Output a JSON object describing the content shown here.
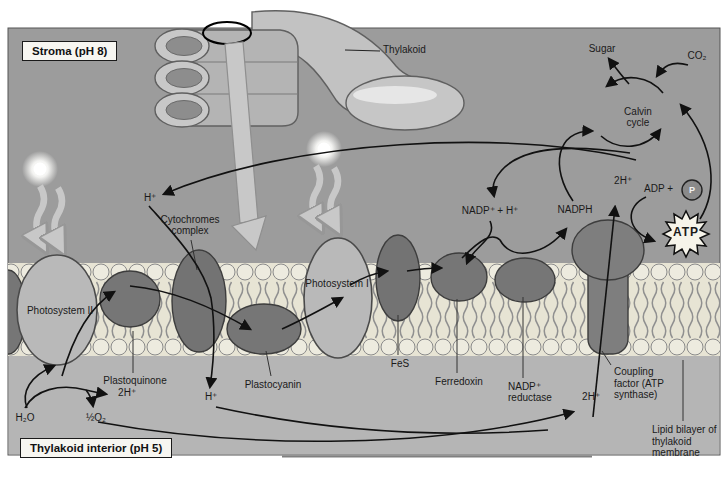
{
  "figure": {
    "type": "textbook-diagram"
  },
  "boxes": {
    "stroma": "Stroma (pH 8)",
    "interior": "Thylakoid interior (pH 5)"
  },
  "top": {
    "thylakoid": "Thylakoid",
    "sugar": "Sugar",
    "co2": "CO₂",
    "calvin1": "Calvin",
    "calvin2": "cycle"
  },
  "stroma_side": {
    "h_plus": "H⁺",
    "nadp_h": "NADP⁺ + H⁺",
    "nadph": "NADPH",
    "two_h": "2H⁺",
    "adp": "ADP +",
    "p": "P",
    "atp": "ATP"
  },
  "membrane": {
    "ps2": "Photosystem II",
    "ps1": "Photosystem I",
    "cyt1": "Cytochromes",
    "cyt2": "complex",
    "pq": "Plastoquinone",
    "pq_h": "2H⁺",
    "plastocyanin": "Plastocyanin",
    "fes": "FeS",
    "ferredoxin": "Ferredoxin",
    "red1": "NADP⁺",
    "red2": "reductase",
    "coupling": "Coupling factor (ATP synthase)",
    "lipid": "Lipid bilayer of thylakoid membrane"
  },
  "interior_side": {
    "h2o": "H₂O",
    "half_o2": "½O₂",
    "h_plus": "H⁺",
    "two_h": "2H⁺"
  },
  "icons": {
    "light_source": "sun-burst-icon",
    "light_rays": "wavy-arrow-icon",
    "granum": "granum-stack-icon",
    "magnifier": "detail-callout-ellipse-icon",
    "zoom_arrow": "zoom-pointer-arrow-icon",
    "phosphate": "circled-P-icon",
    "atp_burst": "starburst-icon"
  },
  "colors": {
    "stroma_bg": "#9c9c9c",
    "interior_bg": "#b5b5b5",
    "membrane_cream": "#e7e4d4",
    "lipid_head": "#edebdf",
    "protein_dark": "#767676",
    "protein_light": "#b9b9b9",
    "arrow_black": "#111111",
    "light_gray_arrow": "#c8c8c8",
    "label_box_bg": "#f7f6f1",
    "atp_star_fill": "#f6f4ea"
  }
}
